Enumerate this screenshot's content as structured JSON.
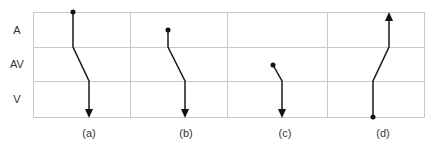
{
  "diagram": {
    "rows": [
      {
        "label": "A",
        "y": 30
      },
      {
        "label": "AV",
        "y": 64
      },
      {
        "label": "V",
        "y": 99
      }
    ],
    "columns": [
      {
        "label": "(a)",
        "x": 89
      },
      {
        "label": "(b)",
        "x": 186
      },
      {
        "label": "(c)",
        "x": 285
      },
      {
        "label": "(d)",
        "x": 383
      }
    ],
    "colors": {
      "grid": "#c8c8c8",
      "path": "#1a1a1a",
      "text": "#333333"
    }
  }
}
